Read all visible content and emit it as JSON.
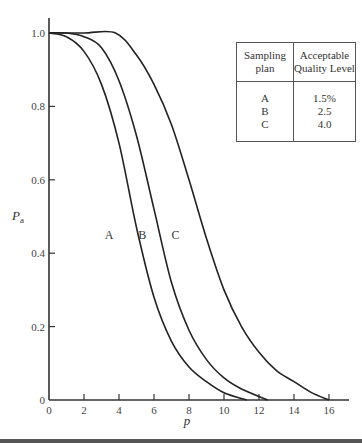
{
  "chart_data": {
    "type": "line",
    "title": "",
    "xlabel": "p",
    "ylabel": "Pa",
    "xlim": [
      0,
      17
    ],
    "ylim": [
      0,
      1.05
    ],
    "x_ticks": [
      "0",
      "2",
      "4",
      "6",
      "8",
      "10",
      "12",
      "14",
      "16"
    ],
    "y_ticks": [
      "0",
      "0.2",
      "0.4",
      "0.6",
      "0.8",
      "1.0"
    ],
    "grid": false,
    "series": [
      {
        "name": "A",
        "x": [
          0,
          1,
          2,
          3,
          4,
          5,
          6,
          7,
          8,
          9,
          10,
          11.3
        ],
        "values": [
          1.0,
          0.99,
          0.95,
          0.86,
          0.7,
          0.47,
          0.28,
          0.16,
          0.09,
          0.05,
          0.02,
          0.0
        ]
      },
      {
        "name": "B",
        "x": [
          0,
          1,
          2,
          3,
          4,
          5,
          6,
          7,
          8,
          9,
          10,
          11,
          12.5
        ],
        "values": [
          1.0,
          1.0,
          0.99,
          0.96,
          0.87,
          0.72,
          0.52,
          0.32,
          0.19,
          0.11,
          0.06,
          0.03,
          0.0
        ]
      },
      {
        "name": "C",
        "x": [
          0,
          2,
          3.8,
          5,
          6,
          7,
          8,
          9,
          10,
          11,
          12,
          13,
          14,
          15,
          16
        ],
        "values": [
          1.0,
          1.0,
          1.0,
          0.94,
          0.86,
          0.75,
          0.6,
          0.44,
          0.3,
          0.2,
          0.13,
          0.08,
          0.05,
          0.02,
          0.0
        ]
      }
    ],
    "curve_labels": [
      {
        "text": "A",
        "x": 4.0,
        "y": 0.45
      },
      {
        "text": "B",
        "x": 5.9,
        "y": 0.45
      },
      {
        "text": "C",
        "x": 7.8,
        "y": 0.45
      }
    ],
    "legend": {
      "position": "top-right",
      "headers": [
        "Sampling plan",
        "Acceptable Quality Level"
      ],
      "rows": [
        {
          "plan": "A",
          "aql": "1.5%"
        },
        {
          "plan": "B",
          "aql": "2.5"
        },
        {
          "plan": "C",
          "aql": "4.0"
        }
      ]
    }
  },
  "legend": {
    "header_plan_line1": "Sampling",
    "header_plan_line2": "plan",
    "header_aql_line1": "Acceptable",
    "header_aql_line2": "Quality Level",
    "rows": [
      {
        "plan": "A",
        "aql": "1.5%"
      },
      {
        "plan": "B",
        "aql": "2.5"
      },
      {
        "plan": "C",
        "aql": "4.0"
      }
    ]
  },
  "axes": {
    "xlabel": "p",
    "ylabel_main": "P",
    "ylabel_sub": "a"
  }
}
